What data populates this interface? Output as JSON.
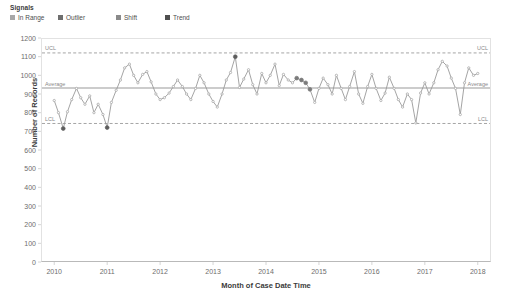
{
  "legend": {
    "title": "Signals",
    "items": [
      {
        "label": "In Range",
        "color": "#a8a8a8"
      },
      {
        "label": "Outlier",
        "color": "#6e6e6e"
      },
      {
        "label": "Shift",
        "color": "#8a8a8a"
      },
      {
        "label": "Trend",
        "color": "#4f4f4f"
      }
    ]
  },
  "axes": {
    "y_title": "Number of Records",
    "x_title": "Month of Case Date Time",
    "y_ticks": [
      "1200",
      "1100",
      "1000",
      "900",
      "800",
      "700",
      "600",
      "500",
      "400",
      "300",
      "200",
      "100",
      "0"
    ],
    "x_ticks": [
      "2010",
      "2011",
      "2012",
      "2013",
      "2014",
      "2015",
      "2016",
      "2017",
      "2018"
    ]
  },
  "limits": {
    "ucl_label": "UCL",
    "average_label": "Average",
    "lcl_label": "LCL",
    "ucl_label_right": "UCL",
    "average_label_right": "Average",
    "lcl_label_right": "LCL"
  },
  "chart_data": {
    "type": "line",
    "title": "",
    "subtitle": "",
    "xlabel": "Month of Case Date Time",
    "ylabel": "Number of Records",
    "xlim": [
      2009.75,
      2018.25
    ],
    "ylim": [
      0,
      1200
    ],
    "ytick_step": 100,
    "grid": false,
    "legend_position": "top-left",
    "line_color": "#9a9a9a",
    "marker_color": "#9a9a9a",
    "signal_colors": {
      "in_range": "#a8a8a8",
      "outlier": "#5d5d5d",
      "shift": "#7b7b7b",
      "trend": "#4f4f4f"
    },
    "control_limits": {
      "ucl": 1120,
      "center": 932,
      "lcl": 742,
      "ucl_style": "dashed",
      "center_style": "solid",
      "lcl_style": "dashed"
    },
    "x": [
      2010.0,
      2010.08,
      2010.17,
      2010.25,
      2010.33,
      2010.42,
      2010.5,
      2010.58,
      2010.67,
      2010.75,
      2010.83,
      2010.92,
      2011.0,
      2011.08,
      2011.17,
      2011.25,
      2011.33,
      2011.42,
      2011.5,
      2011.58,
      2011.67,
      2011.75,
      2011.83,
      2011.92,
      2012.0,
      2012.08,
      2012.17,
      2012.25,
      2012.33,
      2012.42,
      2012.5,
      2012.58,
      2012.67,
      2012.75,
      2012.83,
      2012.92,
      2013.0,
      2013.08,
      2013.17,
      2013.25,
      2013.33,
      2013.42,
      2013.5,
      2013.58,
      2013.67,
      2013.75,
      2013.83,
      2013.92,
      2014.0,
      2014.08,
      2014.17,
      2014.25,
      2014.33,
      2014.42,
      2014.5,
      2014.58,
      2014.67,
      2014.75,
      2014.83,
      2014.92,
      2015.0,
      2015.08,
      2015.17,
      2015.25,
      2015.33,
      2015.42,
      2015.5,
      2015.58,
      2015.67,
      2015.75,
      2015.83,
      2015.92,
      2016.0,
      2016.08,
      2016.17,
      2016.25,
      2016.33,
      2016.42,
      2016.5,
      2016.58,
      2016.67,
      2016.75,
      2016.83,
      2016.92,
      2017.0,
      2017.08,
      2017.17,
      2017.25,
      2017.33,
      2017.42,
      2017.5,
      2017.58,
      2017.67,
      2017.75,
      2017.83,
      2017.92,
      2018.0
    ],
    "values": [
      865,
      800,
      715,
      805,
      870,
      930,
      880,
      845,
      890,
      800,
      845,
      790,
      720,
      855,
      920,
      975,
      1040,
      1060,
      1000,
      960,
      1005,
      1020,
      965,
      900,
      870,
      880,
      905,
      940,
      975,
      940,
      900,
      870,
      930,
      1000,
      960,
      900,
      860,
      830,
      900,
      975,
      1015,
      1100,
      935,
      980,
      1030,
      950,
      900,
      1010,
      960,
      1000,
      1060,
      945,
      1005,
      975,
      960,
      985,
      975,
      960,
      925,
      855,
      930,
      985,
      950,
      900,
      1000,
      930,
      870,
      940,
      1020,
      900,
      850,
      940,
      1005,
      930,
      865,
      905,
      990,
      930,
      870,
      830,
      900,
      870,
      745,
      905,
      960,
      900,
      960,
      1030,
      1075,
      1050,
      985,
      930,
      790,
      960,
      1040,
      1000,
      1010
    ],
    "signals": [
      "in_range",
      "in_range",
      "outlier",
      "in_range",
      "in_range",
      "in_range",
      "in_range",
      "in_range",
      "in_range",
      "in_range",
      "in_range",
      "in_range",
      "outlier",
      "in_range",
      "in_range",
      "in_range",
      "in_range",
      "in_range",
      "in_range",
      "in_range",
      "in_range",
      "in_range",
      "in_range",
      "in_range",
      "in_range",
      "in_range",
      "in_range",
      "in_range",
      "in_range",
      "in_range",
      "in_range",
      "in_range",
      "in_range",
      "in_range",
      "in_range",
      "in_range",
      "in_range",
      "in_range",
      "in_range",
      "in_range",
      "in_range",
      "outlier",
      "in_range",
      "in_range",
      "in_range",
      "in_range",
      "in_range",
      "in_range",
      "in_range",
      "in_range",
      "in_range",
      "in_range",
      "in_range",
      "in_range",
      "in_range",
      "shift",
      "shift",
      "shift",
      "shift",
      "in_range",
      "in_range",
      "in_range",
      "in_range",
      "in_range",
      "in_range",
      "in_range",
      "in_range",
      "in_range",
      "in_range",
      "in_range",
      "in_range",
      "in_range",
      "in_range",
      "in_range",
      "in_range",
      "in_range",
      "in_range",
      "in_range",
      "in_range",
      "in_range",
      "in_range",
      "in_range",
      "in_range",
      "in_range",
      "in_range",
      "in_range",
      "in_range",
      "in_range",
      "in_range",
      "in_range",
      "in_range",
      "in_range",
      "in_range",
      "in_range",
      "in_range",
      "in_range",
      "in_range"
    ]
  }
}
